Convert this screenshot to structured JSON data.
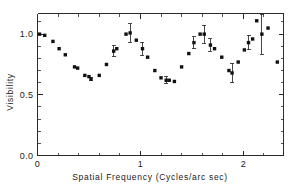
{
  "figure": {
    "background": "#ffffff",
    "marker_color": "#111111",
    "axis_color": "#2b2b2b"
  },
  "chart_data": {
    "type": "scatter",
    "title": "",
    "xlabel": "Spatial  Frequency  (Cycles/arc sec)",
    "ylabel": "Visibility",
    "xlim": [
      0,
      2.39
    ],
    "ylim": [
      0,
      1.17
    ],
    "grid": false,
    "legend": null,
    "xticks": [
      0,
      1,
      2
    ],
    "xticklabels": [
      "0",
      "1",
      "2"
    ],
    "yticks": [
      0.0,
      0.5,
      1.0
    ],
    "yticklabels": [
      "0.0",
      "0.5",
      "1.0"
    ],
    "xminor_step": 0.2,
    "yminor_step": 0.1,
    "point_label": "visibility measurement",
    "points": [
      {
        "x": 0.02,
        "y": 1.0,
        "err": 0.0
      },
      {
        "x": 0.07,
        "y": 0.99,
        "err": 0.0
      },
      {
        "x": 0.15,
        "y": 0.94,
        "err": 0.0
      },
      {
        "x": 0.21,
        "y": 0.88,
        "err": 0.0
      },
      {
        "x": 0.27,
        "y": 0.83,
        "err": 0.0
      },
      {
        "x": 0.36,
        "y": 0.73,
        "err": 0.0
      },
      {
        "x": 0.39,
        "y": 0.72,
        "err": 0.0
      },
      {
        "x": 0.46,
        "y": 0.66,
        "err": 0.0
      },
      {
        "x": 0.5,
        "y": 0.65,
        "err": 0.0
      },
      {
        "x": 0.52,
        "y": 0.63,
        "err": 0.015
      },
      {
        "x": 0.6,
        "y": 0.66,
        "err": 0.0
      },
      {
        "x": 0.67,
        "y": 0.75,
        "err": 0.0
      },
      {
        "x": 0.74,
        "y": 0.86,
        "err": 0.045
      },
      {
        "x": 0.77,
        "y": 0.88,
        "err": 0.0
      },
      {
        "x": 0.86,
        "y": 1.0,
        "err": 0.0
      },
      {
        "x": 0.9,
        "y": 1.01,
        "err": 0.075
      },
      {
        "x": 0.96,
        "y": 0.95,
        "err": 0.0
      },
      {
        "x": 1.02,
        "y": 0.88,
        "err": 0.055
      },
      {
        "x": 1.07,
        "y": 0.81,
        "err": 0.0
      },
      {
        "x": 1.14,
        "y": 0.7,
        "err": 0.0
      },
      {
        "x": 1.2,
        "y": 0.64,
        "err": 0.0
      },
      {
        "x": 1.25,
        "y": 0.62,
        "err": 0.03
      },
      {
        "x": 1.28,
        "y": 0.62,
        "err": 0.0
      },
      {
        "x": 1.33,
        "y": 0.61,
        "err": 0.0
      },
      {
        "x": 1.4,
        "y": 0.73,
        "err": 0.0
      },
      {
        "x": 1.47,
        "y": 0.84,
        "err": 0.0
      },
      {
        "x": 1.52,
        "y": 0.93,
        "err": 0.05
      },
      {
        "x": 1.58,
        "y": 1.0,
        "err": 0.0
      },
      {
        "x": 1.62,
        "y": 1.0,
        "err": 0.075
      },
      {
        "x": 1.68,
        "y": 0.91,
        "err": 0.05
      },
      {
        "x": 1.72,
        "y": 0.88,
        "err": 0.0
      },
      {
        "x": 1.79,
        "y": 0.81,
        "err": 0.0
      },
      {
        "x": 1.86,
        "y": 0.7,
        "err": 0.0
      },
      {
        "x": 1.89,
        "y": 0.68,
        "err": 0.08
      },
      {
        "x": 1.95,
        "y": 0.77,
        "err": 0.0
      },
      {
        "x": 2.01,
        "y": 0.87,
        "err": 0.0
      },
      {
        "x": 2.05,
        "y": 0.93,
        "err": 0.06
      },
      {
        "x": 2.09,
        "y": 0.96,
        "err": 0.0
      },
      {
        "x": 2.13,
        "y": 1.11,
        "err": 0.0
      },
      {
        "x": 2.18,
        "y": 1.0,
        "err": 0.165
      },
      {
        "x": 2.24,
        "y": 1.05,
        "err": 0.0
      },
      {
        "x": 2.33,
        "y": 0.77,
        "err": 0.0
      }
    ]
  }
}
